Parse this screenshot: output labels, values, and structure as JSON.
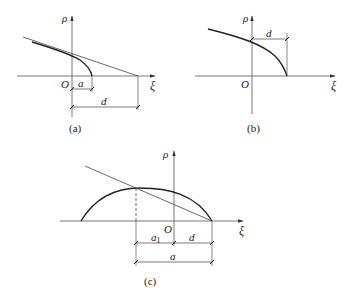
{
  "diagrams": [
    {
      "id": "a",
      "caption": "(a)",
      "axes": {
        "x_label": "ξ",
        "y_label": "ρ",
        "origin_label": "O"
      },
      "dimensions": [
        {
          "label": "a"
        },
        {
          "label": "d"
        }
      ],
      "elements": [
        "steep curve ending at ξ = a",
        "tangent line intersecting ξ axis at ξ = d"
      ]
    },
    {
      "id": "b",
      "caption": "(b)",
      "axes": {
        "x_label": "ξ",
        "y_label": "ρ",
        "origin_label": "O"
      },
      "dimensions": [
        {
          "label": "d"
        }
      ],
      "elements": [
        "concave curve meeting ξ axis at ξ = d"
      ]
    },
    {
      "id": "c",
      "caption": "(c)",
      "axes": {
        "x_label": "ξ",
        "y_label": "ρ",
        "origin_label": "O"
      },
      "dimensions": [
        {
          "label": "a",
          "sub": "1"
        },
        {
          "label": "d"
        },
        {
          "label": "a"
        }
      ],
      "elements": [
        "arc curve from left to ξ = d",
        "straight line through arc peak to ξ = d",
        "dashed vertical line at ξ = -a1"
      ]
    }
  ]
}
